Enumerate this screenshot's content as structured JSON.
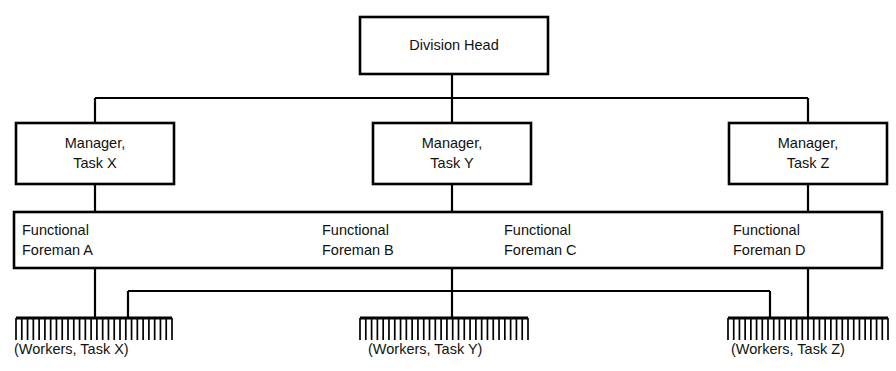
{
  "diagram": {
    "type": "organization-chart",
    "colors": {
      "background": "#ffffff",
      "line": "#000000",
      "text": "#111111",
      "box_fill": "#ffffff"
    },
    "top": {
      "label": "Division Head",
      "box": {
        "x": 360,
        "y": 17,
        "w": 188,
        "h": 57
      }
    },
    "managers": [
      {
        "id": "manager-task-x",
        "line1": "Manager,",
        "line2": "Task X",
        "box": {
          "x": 16,
          "y": 123,
          "w": 158,
          "h": 61
        },
        "stem_x": 95
      },
      {
        "id": "manager-task-y",
        "line1": "Manager,",
        "line2": "Task Y",
        "box": {
          "x": 373,
          "y": 123,
          "w": 158,
          "h": 61
        },
        "stem_x": 452
      },
      {
        "id": "manager-task-z",
        "line1": "Manager,",
        "line2": "Task Z",
        "box": {
          "x": 729,
          "y": 123,
          "w": 158,
          "h": 61
        },
        "stem_x": 808
      }
    ],
    "foreman_band": {
      "box": {
        "x": 14,
        "y": 212,
        "w": 868,
        "h": 56
      },
      "foremen": [
        {
          "id": "functional-foreman-a",
          "line1": "Functional",
          "line2": "Foreman A",
          "text_x": 22
        },
        {
          "id": "functional-foreman-b",
          "line1": "Functional",
          "line2": "Foreman B",
          "text_x": 322
        },
        {
          "id": "functional-foreman-c",
          "line1": "Functional",
          "line2": "Foreman C",
          "text_x": 504
        },
        {
          "id": "functional-foreman-d",
          "line1": "Functional",
          "line2": "Foreman D",
          "text_x": 733
        }
      ]
    },
    "worker_groups": [
      {
        "id": "workers-task-x",
        "caption": "(Workers, Task X)",
        "bar": {
          "x1": 16,
          "x2": 172,
          "y": 318
        },
        "teeth": 28,
        "tooth_length": 22,
        "caption_x": 14,
        "caption_y": 350
      },
      {
        "id": "workers-task-y",
        "caption": "(Workers, Task Y)",
        "bar": {
          "x1": 360,
          "x2": 528,
          "y": 318
        },
        "teeth": 30,
        "tooth_length": 22,
        "caption_x": 368,
        "caption_y": 350
      },
      {
        "id": "workers-task-z",
        "caption": "(Workers, Task Z)",
        "bar": {
          "x1": 728,
          "x2": 888,
          "y": 318
        },
        "teeth": 29,
        "tooth_length": 22,
        "caption_x": 731,
        "caption_y": 350
      }
    ],
    "connectors": {
      "top_bus_y": 98,
      "top_bus_x1": 95,
      "top_bus_x2": 808,
      "top_stem_x": 452,
      "top_stem_y1": 74,
      "top_stem_y2": 98,
      "manager_drops_y1": 184,
      "manager_drops_y2": 212,
      "lower_bus_y": 291,
      "lower_bus_x1": 128,
      "lower_bus_x2": 770,
      "lower_drop_direct": [
        {
          "x": 95,
          "y1": 268,
          "y2": 318
        },
        {
          "x": 452,
          "y1": 268,
          "y2": 318
        },
        {
          "x": 808,
          "y1": 268,
          "y2": 318
        }
      ],
      "lower_bus_ends": [
        {
          "x": 128,
          "y1": 291,
          "y2": 318
        },
        {
          "x": 770,
          "y1": 291,
          "y2": 318
        }
      ],
      "lower_bus_source_x": 452
    }
  }
}
